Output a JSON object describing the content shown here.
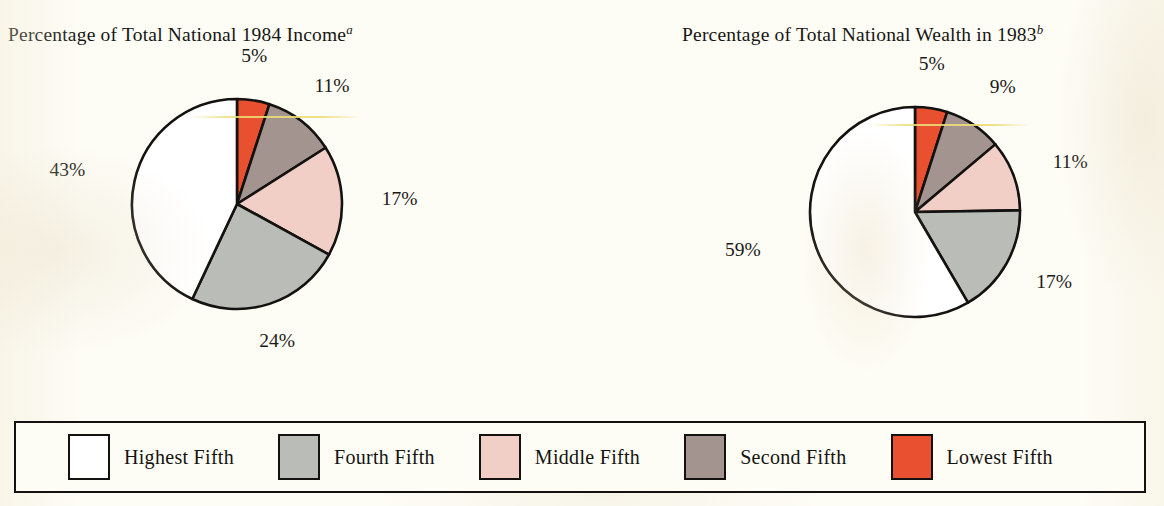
{
  "figure": {
    "background_color": "#fdfcf5",
    "outline_color": "#141210"
  },
  "charts": [
    {
      "title_main": "Percentage of Total National 1984 Income",
      "title_superscript": "a",
      "center": {
        "x": 237,
        "y": 204
      },
      "radius": 105
    },
    {
      "title_main": "Percentage of Total National Wealth in 1983",
      "title_superscript": "b",
      "center": {
        "x": 333,
        "y": 212
      },
      "radius": 105
    }
  ],
  "legend": {
    "items": [
      {
        "label": "Highest Fifth",
        "color": "#ffffff"
      },
      {
        "label": "Fourth Fifth",
        "color": "#b9bcb7"
      },
      {
        "label": "Middle Fifth",
        "color": "#f2cfc6"
      },
      {
        "label": "Second Fifth",
        "color": "#a39490"
      },
      {
        "label": "Lowest Fifth",
        "color": "#e8502f"
      }
    ]
  },
  "chart_data": [
    {
      "type": "pie",
      "title": "Percentage of Total National 1984 Income",
      "title_superscript": "a",
      "categories": [
        "Lowest Fifth",
        "Second Fifth",
        "Middle Fifth",
        "Fourth Fifth",
        "Highest Fifth"
      ],
      "values": [
        5,
        11,
        17,
        24,
        43
      ],
      "labels": [
        "5%",
        "11%",
        "17%",
        "24%",
        "43%"
      ],
      "colors": [
        "#e8502f",
        "#a39490",
        "#f2cfc6",
        "#b9bcb7",
        "#ffffff"
      ],
      "unit": "percent",
      "start_angle_deg": 0,
      "direction": "clockwise",
      "legend_position": "bottom",
      "grid": false
    },
    {
      "type": "pie",
      "title": "Percentage of Total National Wealth in 1983",
      "title_superscript": "b",
      "categories": [
        "Lowest Fifth",
        "Second Fifth",
        "Middle Fifth",
        "Fourth Fifth",
        "Highest Fifth"
      ],
      "values": [
        5,
        9,
        11,
        17,
        59
      ],
      "labels": [
        "5%",
        "9%",
        "11%",
        "17%",
        "59%"
      ],
      "colors": [
        "#e8502f",
        "#a39490",
        "#f2cfc6",
        "#b9bcb7",
        "#ffffff"
      ],
      "unit": "percent",
      "start_angle_deg": 0,
      "direction": "clockwise",
      "legend_position": "bottom",
      "grid": false
    }
  ]
}
